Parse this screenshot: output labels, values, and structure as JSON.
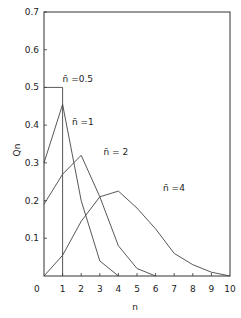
{
  "chart_data": {
    "type": "line",
    "title": "",
    "xlabel": "n",
    "ylabel": "Qn",
    "xlim": [
      0,
      10
    ],
    "ylim": [
      0,
      0.7
    ],
    "grid": false,
    "xticks": [
      "0",
      "1",
      "2",
      "3",
      "4",
      "5",
      "6",
      "7",
      "8",
      "9",
      "10"
    ],
    "yticks": [
      "0.1",
      "0.2",
      "0.3",
      "0.4",
      "0.5",
      "0.6",
      "0.7"
    ],
    "origin_label": "0",
    "series": [
      {
        "name": "n̄ = 0.5",
        "label": "n̄ =0.5",
        "step": true,
        "x": [
          0,
          1,
          1
        ],
        "values": [
          0.5,
          0.5,
          0
        ]
      },
      {
        "name": "n̄ = 1",
        "label": "n̄ =1",
        "x": [
          0,
          1,
          2,
          3,
          4
        ],
        "values": [
          0.3,
          0.455,
          0.2,
          0.04,
          0.0
        ]
      },
      {
        "name": "n̄ = 2",
        "label": "n̄ = 2",
        "x": [
          0,
          1,
          2,
          3,
          4,
          5,
          6
        ],
        "values": [
          0.19,
          0.27,
          0.32,
          0.21,
          0.08,
          0.02,
          0.0
        ]
      },
      {
        "name": "n̄ = 4",
        "label": "n̄ =4",
        "x": [
          0,
          1,
          2,
          3,
          4,
          5,
          6,
          7,
          8,
          9,
          10
        ],
        "values": [
          0.0,
          0.055,
          0.145,
          0.21,
          0.225,
          0.18,
          0.125,
          0.06,
          0.03,
          0.01,
          0.0
        ]
      }
    ]
  }
}
